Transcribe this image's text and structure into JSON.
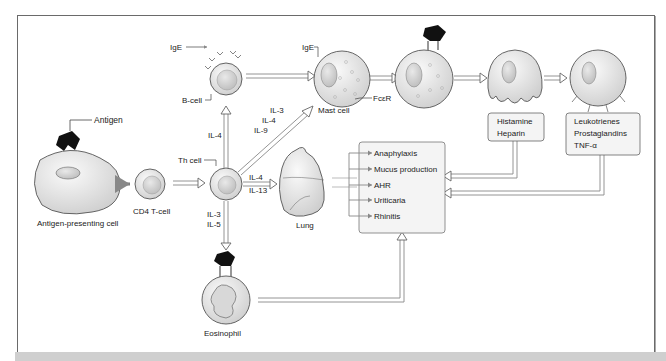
{
  "figure": {
    "colors": {
      "frame_border": "#6a6a6a",
      "cell_fill": "#e8e8e8",
      "cell_stroke": "#555555",
      "arrow_stroke": "#7a7a7a",
      "antigen": "#111111",
      "box_fill": "#f4f4f4",
      "bottom_strip": "#cfcfcf"
    },
    "labels": {
      "antigen": "Antigen",
      "apc": "Antigen-presenting cell",
      "cd4": "CD4 T-cell",
      "th_cell": "Th cell",
      "b_cell": "B-cell",
      "ige_b": "IgE",
      "ige_mast": "IgE",
      "mast_cell": "Mast cell",
      "fcer": "FcεR",
      "lung": "Lung",
      "eosinophil": "Eosinophil"
    },
    "cytokines": {
      "to_bcell": "IL-4",
      "to_mast": [
        "IL-3",
        "IL-4",
        "IL-9"
      ],
      "to_lung": [
        "IL-4",
        "IL-13"
      ],
      "to_eosinophil": [
        "IL-3",
        "IL-5"
      ]
    },
    "mediator_boxes": {
      "degranulation": [
        "Histamine",
        "Heparin"
      ],
      "synthesis": [
        "Leukotrienes",
        "Prostaglandins",
        "TNF-α"
      ]
    },
    "outcomes_box": {
      "items": [
        "Anaphylaxis",
        "Mucus production",
        "AHR",
        "Uriticaria",
        "Rhinitis"
      ]
    }
  }
}
